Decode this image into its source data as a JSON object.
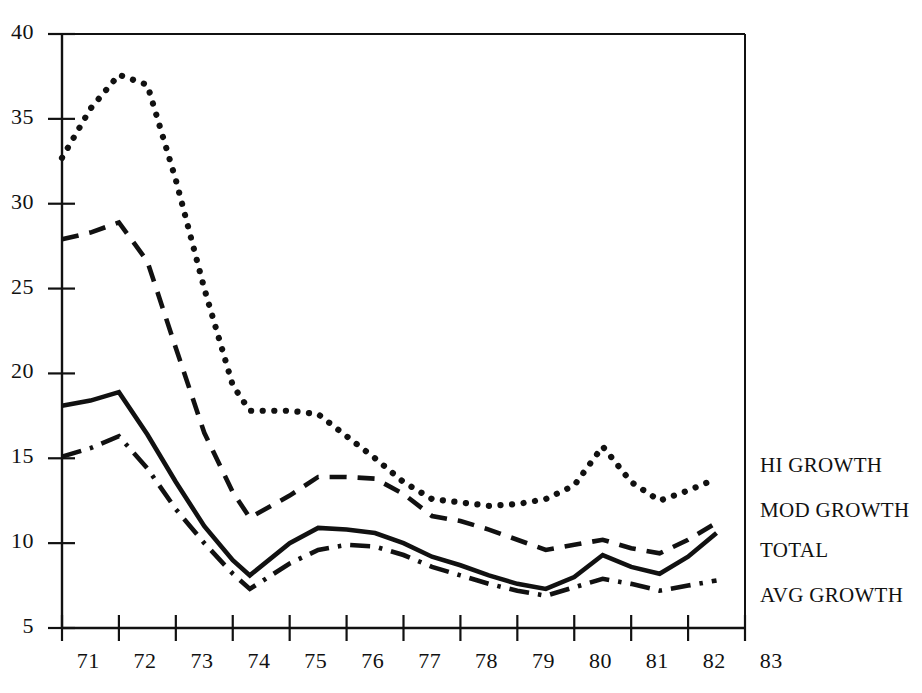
{
  "chart_data": {
    "type": "line",
    "title": "",
    "subtitle": "",
    "xlabel": "",
    "ylabel": "",
    "xlim": [
      71,
      83
    ],
    "ylim": [
      5,
      40
    ],
    "grid": false,
    "legend_position": "right-inline",
    "x_tick_labels": [
      "71",
      "72",
      "73",
      "74",
      "75",
      "76",
      "77",
      "78",
      "79",
      "80",
      "81",
      "82",
      "83"
    ],
    "y_tick_labels": [
      "5",
      "10",
      "15",
      "20",
      "25",
      "30",
      "35",
      "40"
    ],
    "y_ticks": [
      5,
      10,
      15,
      20,
      25,
      30,
      35,
      40
    ],
    "x": [
      71.0,
      71.5,
      72.0,
      72.5,
      73.0,
      73.5,
      74.0,
      74.3,
      75.0,
      75.5,
      76.0,
      76.5,
      77.0,
      77.5,
      78.0,
      78.5,
      79.0,
      79.5,
      80.0,
      80.5,
      81.0,
      81.5,
      82.0,
      82.5
    ],
    "series": [
      {
        "name": "HI GROWTH",
        "style": "dotted",
        "color": "#111111",
        "values": [
          32.7,
          35.6,
          37.6,
          37.0,
          31.4,
          25.0,
          19.3,
          17.8,
          17.8,
          17.6,
          16.3,
          15.0,
          13.6,
          12.6,
          12.4,
          12.2,
          12.3,
          12.6,
          13.4,
          15.7,
          13.6,
          12.5,
          13.1,
          13.8
        ]
      },
      {
        "name": "MOD GROWTH",
        "style": "dashed",
        "color": "#111111",
        "values": [
          27.9,
          28.3,
          28.9,
          26.6,
          21.5,
          16.5,
          13.0,
          11.5,
          12.8,
          13.9,
          13.9,
          13.8,
          12.9,
          11.6,
          11.3,
          10.8,
          10.2,
          9.6,
          9.9,
          10.2,
          9.7,
          9.4,
          10.2,
          11.2
        ]
      },
      {
        "name": "TOTAL",
        "style": "solid",
        "color": "#111111",
        "values": [
          18.1,
          18.4,
          18.9,
          16.4,
          13.6,
          11.0,
          9.0,
          8.1,
          10.0,
          10.9,
          10.8,
          10.6,
          10.0,
          9.2,
          8.7,
          8.1,
          7.6,
          7.3,
          8.0,
          9.3,
          8.6,
          8.2,
          9.2,
          10.6
        ]
      },
      {
        "name": "AVG GROWTH",
        "style": "dash-dot",
        "color": "#111111",
        "values": [
          15.1,
          15.6,
          16.3,
          14.4,
          12.0,
          10.0,
          8.2,
          7.3,
          8.8,
          9.6,
          9.9,
          9.8,
          9.3,
          8.6,
          8.1,
          7.6,
          7.2,
          6.9,
          7.4,
          7.9,
          7.6,
          7.2,
          7.5,
          7.8
        ]
      }
    ]
  },
  "legend": {
    "items": [
      {
        "label": "HI GROWTH"
      },
      {
        "label": "MOD GROWTH"
      },
      {
        "label": "TOTAL"
      },
      {
        "label": "AVG GROWTH"
      }
    ]
  },
  "axes": {
    "left_label": "",
    "bottom_label": ""
  }
}
